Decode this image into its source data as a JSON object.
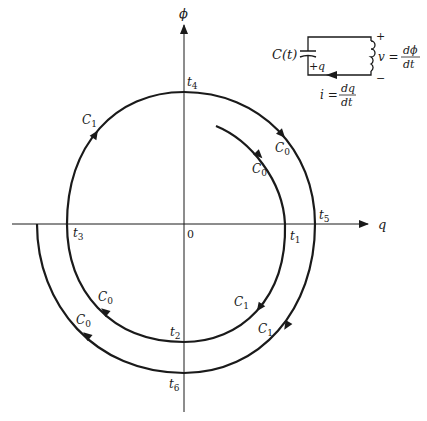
{
  "axes": {
    "x_label": "q",
    "y_label": "ϕ",
    "origin_label": "0"
  },
  "time_labels": [
    {
      "base": "t",
      "sub": "1"
    },
    {
      "base": "t",
      "sub": "2"
    },
    {
      "base": "t",
      "sub": "3"
    },
    {
      "base": "t",
      "sub": "4"
    },
    {
      "base": "t",
      "sub": "5"
    },
    {
      "base": "t",
      "sub": "6"
    }
  ],
  "curve_labels": {
    "c0": {
      "base": "C",
      "sub": "0"
    },
    "c1": {
      "base": "C",
      "sub": "1"
    }
  },
  "circuit": {
    "capacitor_label": "C(t)",
    "charge_label": "q",
    "charge_sign": "+",
    "plus_sign": "+",
    "minus_sign": "−",
    "voltage_lhs": "v =",
    "voltage_num": "dϕ",
    "voltage_den": "dt",
    "current_lhs": "i =",
    "current_num": "dq",
    "current_den": "dt"
  },
  "colors": {
    "stroke": "#1a1a1a",
    "background": "#ffffff"
  }
}
